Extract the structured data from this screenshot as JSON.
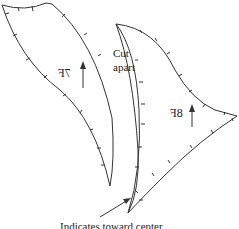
{
  "diagram": {
    "pieces": [
      {
        "id": "7F",
        "label": "7F",
        "mirrored": true
      },
      {
        "id": "8F",
        "label": "8F",
        "mirrored": true
      }
    ],
    "cut_label_line1": "Cut",
    "cut_label_line2": "apart",
    "indicator_caption": "Indicates toward center",
    "stroke_color": "#333333"
  }
}
